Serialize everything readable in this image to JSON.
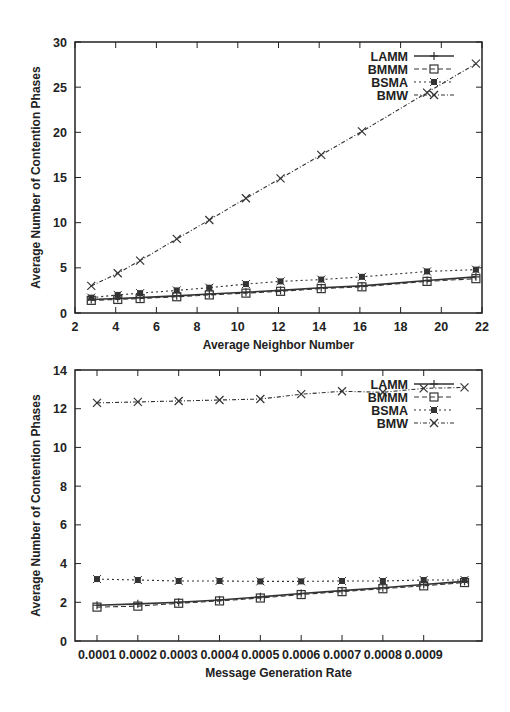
{
  "chart_data": [
    {
      "type": "line",
      "title": "",
      "xlabel": "Average Neighbor Number",
      "ylabel": "Average Number of Contention Phases",
      "xlim": [
        2,
        22
      ],
      "ylim": [
        0,
        30
      ],
      "xticks": [
        2,
        4,
        6,
        8,
        10,
        12,
        14,
        16,
        18,
        20,
        22
      ],
      "yticks": [
        0,
        5,
        10,
        15,
        20,
        25,
        30
      ],
      "grid": false,
      "legend_position": "top-right",
      "x": [
        2.8,
        4.1,
        5.2,
        7.0,
        8.6,
        10.4,
        12.1,
        14.1,
        16.1,
        19.3,
        21.7
      ],
      "series": [
        {
          "name": "LAMM",
          "style": "solid",
          "marker": "plus",
          "values": [
            1.5,
            1.6,
            1.7,
            1.9,
            2.1,
            2.3,
            2.5,
            2.8,
            3.0,
            3.6,
            4.0
          ]
        },
        {
          "name": "BMMM",
          "style": "dashed",
          "marker": "square",
          "values": [
            1.4,
            1.5,
            1.6,
            1.8,
            2.0,
            2.2,
            2.4,
            2.7,
            2.9,
            3.5,
            3.8
          ]
        },
        {
          "name": "BSMA",
          "style": "dotted",
          "marker": "filled-star",
          "values": [
            1.7,
            2.0,
            2.2,
            2.5,
            2.8,
            3.2,
            3.5,
            3.7,
            4.0,
            4.6,
            4.8
          ]
        },
        {
          "name": "BMW",
          "style": "dash-dot",
          "marker": "cross",
          "values": [
            3.0,
            4.4,
            5.8,
            8.2,
            10.3,
            12.7,
            14.9,
            17.5,
            20.1,
            24.4,
            27.6
          ]
        }
      ]
    },
    {
      "type": "line",
      "title": "",
      "xlabel": "Message Generation Rate",
      "ylabel": "Average Number of Contention Phases",
      "xlim": [
        5e-05,
        0.00095
      ],
      "ylim": [
        0,
        14
      ],
      "xticks": [
        "0.0001",
        "0.0002",
        "0.0003",
        "0.0004",
        "0.0005",
        "0.0006",
        "0.0007",
        "0.0008",
        "0.0009"
      ],
      "yticks": [
        0,
        2,
        4,
        6,
        8,
        10,
        12,
        14
      ],
      "grid": false,
      "legend_position": "top-right",
      "x": [
        0.0001,
        0.00019,
        0.00028,
        0.00037,
        0.00046,
        0.00055,
        0.00064,
        0.00073,
        0.00082,
        0.00091
      ],
      "series": [
        {
          "name": "LAMM",
          "style": "solid",
          "marker": "plus",
          "values": [
            1.85,
            1.92,
            2.0,
            2.12,
            2.28,
            2.45,
            2.6,
            2.75,
            2.92,
            3.08
          ]
        },
        {
          "name": "BMMM",
          "style": "dashed",
          "marker": "square",
          "values": [
            1.75,
            1.8,
            1.95,
            2.07,
            2.22,
            2.4,
            2.55,
            2.7,
            2.85,
            3.02
          ]
        },
        {
          "name": "BSMA",
          "style": "dotted",
          "marker": "filled-star",
          "values": [
            3.2,
            3.15,
            3.1,
            3.1,
            3.08,
            3.08,
            3.1,
            3.1,
            3.15,
            3.15
          ]
        },
        {
          "name": "BMW",
          "style": "dash-dot",
          "marker": "cross",
          "values": [
            12.3,
            12.35,
            12.4,
            12.45,
            12.5,
            12.75,
            12.9,
            12.85,
            13.05,
            13.1
          ]
        }
      ]
    }
  ],
  "charts": {
    "top": {
      "xlabel": "Average Neighbor Number",
      "ylabel": "Average Number of Contention Phases",
      "legend": [
        "LAMM",
        "BMMM",
        "BSMA",
        "BMW"
      ]
    },
    "bottom": {
      "xlabel": "Message Generation Rate",
      "ylabel": "Average Number of Contention Phases",
      "legend": [
        "LAMM",
        "BMMM",
        "BSMA",
        "BMW"
      ]
    }
  },
  "colors": {
    "axis": "#222222",
    "line": "#333333",
    "background": "#ffffff"
  }
}
